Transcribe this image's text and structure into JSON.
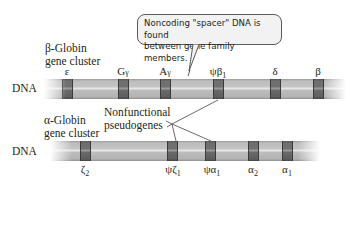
{
  "callout": {
    "line1": "Noncoding \"spacer\" DNA is found",
    "line2": "between gene family members."
  },
  "beta_cluster": {
    "title_line1": "β-Globin",
    "title_line2": "gene cluster",
    "dna_label": "DNA",
    "genes": [
      {
        "symbol": "ε",
        "sub": "",
        "pre": ""
      },
      {
        "symbol": "γ",
        "sub": "",
        "pre": "G"
      },
      {
        "symbol": "γ",
        "sub": "",
        "pre": "A"
      },
      {
        "symbol": "ψβ",
        "sub": "1",
        "pre": ""
      },
      {
        "symbol": "δ",
        "sub": "",
        "pre": ""
      },
      {
        "symbol": "β",
        "sub": "",
        "pre": ""
      }
    ]
  },
  "alpha_cluster": {
    "title_line1": "α-Globin",
    "title_line2": "gene cluster",
    "dna_label": "DNA",
    "genes": [
      {
        "symbol": "ζ",
        "sub": "2",
        "pre": ""
      },
      {
        "symbol": "ψζ",
        "sub": "1",
        "pre": ""
      },
      {
        "symbol": "ψα",
        "sub": "1",
        "pre": ""
      },
      {
        "symbol": "α",
        "sub": "2",
        "pre": ""
      },
      {
        "symbol": "α",
        "sub": "1",
        "pre": ""
      }
    ]
  },
  "pseudogenes_label": {
    "line1": "Nonfunctional",
    "line2": "pseudogenes"
  },
  "colors": {
    "strip": "#c4c4c4",
    "gene": "#6f6f6f",
    "callout_bg": "#f2f2f2",
    "callout_border": "#5a5a5a"
  }
}
